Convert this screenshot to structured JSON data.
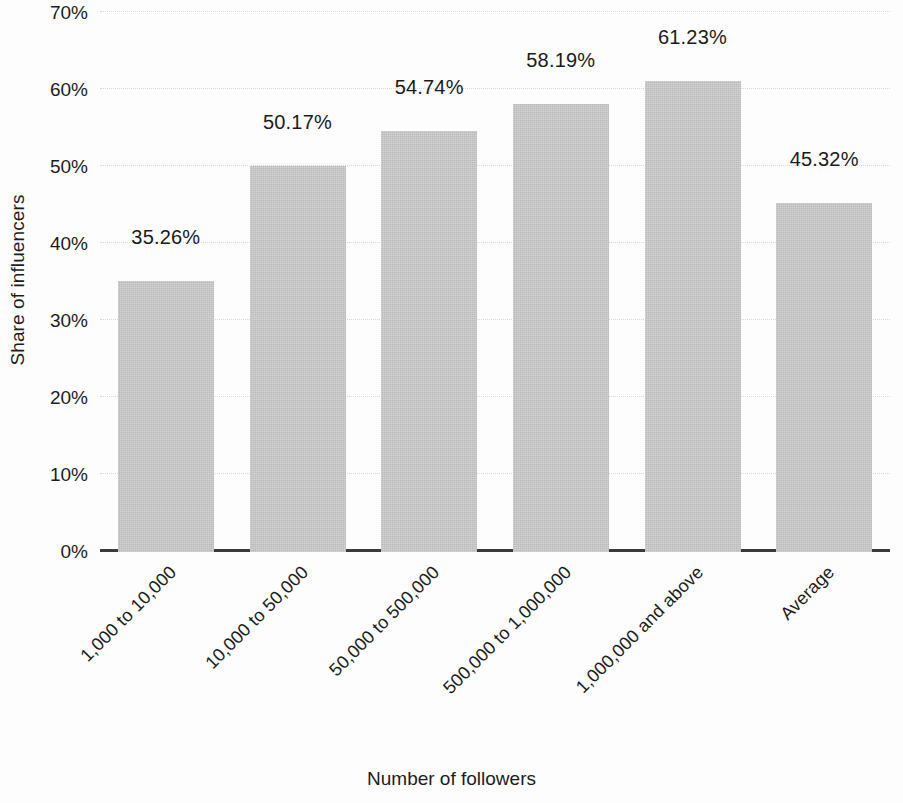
{
  "chart_data": {
    "type": "bar",
    "title": "",
    "xlabel": "Number of followers",
    "ylabel": "Share of influencers",
    "categories": [
      "1,000 to 10,000",
      "10,000 to 50,000",
      "50,000 to 500,000",
      "500,000 to 1,000,000",
      "1,000,000 and above",
      "Average"
    ],
    "values": [
      35.26,
      50.17,
      54.74,
      58.19,
      61.23,
      45.32
    ],
    "value_labels": [
      "35.26%",
      "50.17%",
      "54.74%",
      "58.19%",
      "61.23%",
      "45.32%"
    ],
    "ylim": [
      0,
      70
    ],
    "ytick_values": [
      0,
      10,
      20,
      30,
      40,
      50,
      60,
      70
    ],
    "ytick_labels": [
      "0%",
      "10%",
      "20%",
      "30%",
      "40%",
      "50%",
      "60%",
      "70%"
    ],
    "grid": true,
    "grid_axis": "y",
    "legend": "none",
    "bar_color": "#c8c8c8",
    "axis_color": "#3a3a3a",
    "gridline_color": "#d8d8d8",
    "text_color": "#1c1c1c",
    "background_color": "#fdfdfd"
  }
}
